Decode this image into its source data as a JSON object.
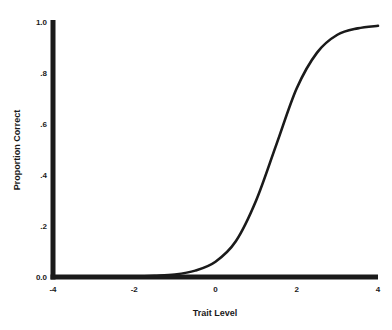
{
  "chart_data": {
    "type": "line",
    "title": "",
    "xlabel": "Trait Level",
    "ylabel": "Proportion Correct",
    "xlim": [
      -4,
      4
    ],
    "ylim": [
      0,
      1
    ],
    "grid": false,
    "x_ticks": [
      -4,
      -2,
      0,
      2,
      4
    ],
    "x_tick_labels": [
      "-4",
      "-2",
      "0",
      "2",
      "4"
    ],
    "y_ticks": [
      0,
      0.2,
      0.4,
      0.6,
      0.8,
      1.0
    ],
    "y_tick_labels": [
      "0.0",
      ".2",
      ".4",
      ".6",
      ".8",
      "1.0"
    ],
    "series": [
      {
        "name": "item characteristic curve",
        "color": "#1a1a1a",
        "x": [
          -4,
          -3.5,
          -3,
          -2.5,
          -2,
          -1.5,
          -1,
          -0.5,
          0,
          0.5,
          1,
          1.5,
          2,
          2.5,
          3,
          3.5,
          4
        ],
        "y": [
          0.0,
          0.0,
          0.0,
          0.001,
          0.002,
          0.005,
          0.01,
          0.025,
          0.06,
          0.14,
          0.3,
          0.52,
          0.74,
          0.88,
          0.95,
          0.975,
          0.985
        ]
      }
    ]
  }
}
